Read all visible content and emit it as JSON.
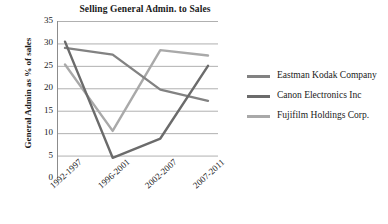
{
  "chart_data": {
    "type": "line",
    "title": "Selling General Admin. to Sales",
    "xlabel": "",
    "ylabel": "General Admin as % of sales",
    "categories": [
      "1992-1997",
      "1996-2001",
      "2002-2007",
      "2007-2011"
    ],
    "series": [
      {
        "name": "Eastman Kodak Company",
        "color": "#828282",
        "values": [
          29.0,
          27.5,
          19.7,
          17.2
        ]
      },
      {
        "name": "Canon Electronics Inc",
        "color": "#6b6b6b",
        "values": [
          30.4,
          4.5,
          8.8,
          25.0
        ]
      },
      {
        "name": "Fujifilm Holdings Corp.",
        "color": "#a9a9a9",
        "values": [
          25.3,
          10.5,
          28.5,
          27.3
        ]
      }
    ],
    "ylim": [
      0,
      35
    ],
    "yticks": [
      "0",
      "5",
      "10",
      "15",
      "20",
      "25",
      "30",
      "35"
    ],
    "grid": true,
    "legend_position": "right",
    "gridline_color": "#b0b0b0",
    "axis_color": "#8c8c8c"
  },
  "legend": {
    "entries": [
      {
        "label_line1": "Eastman Kodak",
        "label_line2": "Company"
      },
      {
        "label_line1": "Canon Electronics Inc",
        "label_line2": ""
      },
      {
        "label_line1": "Fujifilm Holdings",
        "label_line2": "Corp."
      }
    ]
  }
}
